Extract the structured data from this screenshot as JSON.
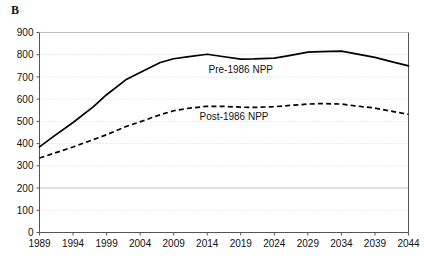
{
  "panel": {
    "letter": "B"
  },
  "chart_data": {
    "type": "line",
    "title": "",
    "subtitle": "",
    "xlabel": "",
    "ylabel": "",
    "xlim": [
      1989,
      2044
    ],
    "ylim": [
      0,
      900
    ],
    "grid": true,
    "legend_position": "inline-annotation",
    "x_tick_labels": [
      "1989",
      "1994",
      "1999",
      "2004",
      "2009",
      "2014",
      "2019",
      "2024",
      "2029",
      "2034",
      "2039",
      "2044"
    ],
    "x_ticks": [
      1989,
      1994,
      1999,
      2004,
      2009,
      2014,
      2019,
      2024,
      2029,
      2034,
      2039,
      2044
    ],
    "y_tick_labels": [
      "0",
      "100",
      "200",
      "300",
      "400",
      "500",
      "600",
      "700",
      "800",
      "900"
    ],
    "y_ticks": [
      0,
      100,
      200,
      300,
      400,
      500,
      600,
      700,
      800,
      900
    ],
    "x": [
      1989,
      1991,
      1994,
      1997,
      1999,
      2002,
      2004,
      2007,
      2009,
      2011,
      2014,
      2016,
      2019,
      2021,
      2024,
      2026,
      2029,
      2031,
      2034,
      2036,
      2039,
      2041,
      2044
    ],
    "series": [
      {
        "name": "Pre-1986 NPP",
        "style": "solid",
        "label": "Pre-1986 NPP",
        "label_x": 2019,
        "label_y": 735,
        "values": [
          385,
          430,
          495,
          565,
          620,
          690,
          720,
          765,
          782,
          790,
          802,
          793,
          780,
          781,
          785,
          795,
          812,
          814,
          816,
          805,
          788,
          772,
          750
        ]
      },
      {
        "name": "Post-1986 NPP",
        "style": "dashed",
        "label": "Post-1986 NPP",
        "label_x": 2018,
        "label_y": 520,
        "values": [
          335,
          355,
          385,
          418,
          440,
          478,
          498,
          530,
          548,
          558,
          568,
          568,
          564,
          563,
          566,
          571,
          578,
          580,
          578,
          570,
          560,
          548,
          532
        ]
      }
    ]
  }
}
